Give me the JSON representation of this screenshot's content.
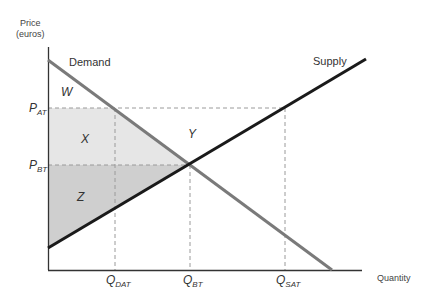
{
  "diagram": {
    "y_axis_title_line1": "Price",
    "y_axis_title_line2": "(euros)",
    "x_axis_title": "Quantity",
    "curves": {
      "demand": {
        "label": "Demand",
        "color": "#7a7a7a"
      },
      "supply": {
        "label": "Supply",
        "color": "#1a1a1a"
      }
    },
    "areas": {
      "W": "W",
      "X": "X",
      "Y": "Y",
      "Z": "Z",
      "x_fill": "#e6e6e6",
      "z_fill": "#cfcfcf"
    },
    "y_ticks": {
      "p_at": {
        "main": "P",
        "sub": "AT"
      },
      "p_bt": {
        "main": "P",
        "sub": "BT"
      }
    },
    "x_ticks": {
      "q_dat": {
        "main": "Q",
        "sub": "DAT"
      },
      "q_bt": {
        "main": "Q",
        "sub": "BT"
      },
      "q_sat": {
        "main": "Q",
        "sub": "SAT"
      }
    }
  }
}
